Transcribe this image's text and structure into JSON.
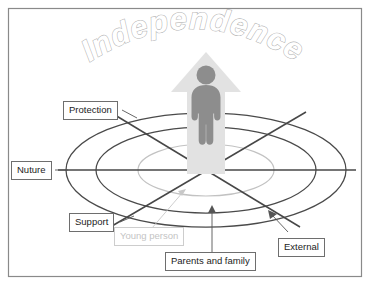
{
  "diagram": {
    "title": "Independence",
    "title_style": "arched-outline-text",
    "center_icon": "person-figure-icon",
    "arrow_icon": "up-arrow-icon",
    "labels": [
      {
        "id": "protection",
        "text": "Protection",
        "style": "dark"
      },
      {
        "id": "nuture",
        "text": "Nuture",
        "style": "dark"
      },
      {
        "id": "support",
        "text": "Support",
        "style": "dark"
      },
      {
        "id": "young-person",
        "text": "Young person",
        "style": "muted"
      },
      {
        "id": "parents-and-family",
        "text": "Parents and family",
        "style": "dark"
      },
      {
        "id": "external",
        "text": "External",
        "style": "dark"
      }
    ],
    "rings": [
      {
        "id": "outer-ring",
        "color": "#4a4a4a"
      },
      {
        "id": "middle-ring",
        "color": "#4a4a4a"
      },
      {
        "id": "inner-ring",
        "color": "#c2c2c2"
      }
    ],
    "axes": [
      {
        "id": "horizontal-axis",
        "color": "#474747"
      },
      {
        "id": "diagonal-axis-protection-external",
        "color": "#474747"
      },
      {
        "id": "diagonal-axis-support",
        "color": "#474747"
      }
    ],
    "colors": {
      "frame": "#8a8a8a",
      "ring_dark": "#4a4a4a",
      "ring_light": "#c2c2c2",
      "axis": "#474747",
      "arrow_fill": "#e2e2e2",
      "person_fill": "#8d8d8d",
      "label_border": "#6e6e6e",
      "label_muted": "#c4c4c4",
      "title_outline": "#b4b4b4",
      "background": "#ffffff"
    }
  }
}
